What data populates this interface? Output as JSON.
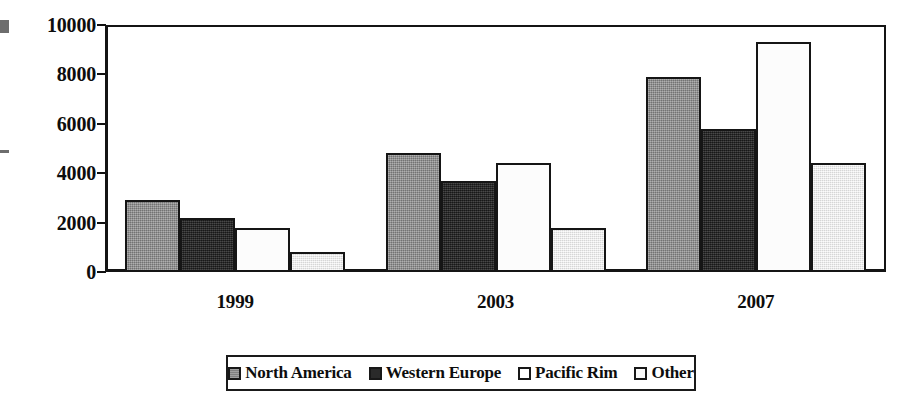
{
  "chart_data": {
    "type": "bar",
    "title": "",
    "subtitle": "",
    "xlabel": "",
    "ylabel": "",
    "categories": [
      "1999",
      "2003",
      "2007"
    ],
    "series": [
      {
        "name": "North America",
        "color": "#8e8e8e",
        "values": [
          2900,
          4800,
          7900
        ]
      },
      {
        "name": "Western Europe",
        "color": "#272727",
        "values": [
          2200,
          3700,
          5800
        ]
      },
      {
        "name": "Pacific Rim",
        "color": "#ffffff",
        "values": [
          1800,
          4400,
          9300
        ]
      },
      {
        "name": "Other",
        "color": "#ededed",
        "values": [
          800,
          1800,
          4400
        ]
      }
    ],
    "ylim": [
      0,
      10000
    ],
    "yticks": [
      0,
      2000,
      4000,
      6000,
      8000,
      10000
    ],
    "ytick_labels": [
      "0",
      "2000",
      "4000",
      "6000",
      "8000",
      "10000"
    ],
    "grid": false,
    "legend_position": "bottom",
    "grouped": true
  },
  "axes": {
    "y_tick_labels": [
      "10000",
      "8000",
      "6000",
      "4000",
      "2000",
      "0"
    ],
    "x_tick_labels": [
      "1999",
      "2003",
      "2007"
    ]
  },
  "legend": {
    "items": [
      {
        "label": "North America",
        "swatch": "legend-swatch-north-america"
      },
      {
        "label": "Western Europe",
        "swatch": "legend-swatch-western-europe"
      },
      {
        "label": "Pacific Rim",
        "swatch": "legend-swatch-pacific-rim"
      },
      {
        "label": "Other",
        "swatch": "legend-swatch-other"
      }
    ]
  }
}
